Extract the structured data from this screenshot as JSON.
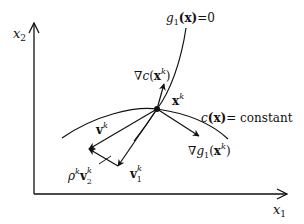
{
  "diagram": {
    "axes": {
      "x_label": "x",
      "x_sub": "1",
      "y_label": "x",
      "y_sub": "2"
    },
    "curves": {
      "constraint": {
        "func": "g",
        "sub": "1",
        "arg": "(x)",
        "rhs": "=0"
      },
      "contour": {
        "func": "c",
        "arg": "(x)",
        "rhs": "= constant"
      }
    },
    "point": {
      "label": "x",
      "sup": "k"
    },
    "vectors": {
      "grad_c": {
        "nabla": "∇",
        "func": "c",
        "open": "(",
        "var": "x",
        "sup": "k",
        "close": ")"
      },
      "grad_g1": {
        "nabla": "∇",
        "func": "g",
        "sub": "1",
        "open": "(",
        "var": "x",
        "sup": "k",
        "close": ")"
      },
      "v": {
        "var": "v",
        "sup": "k"
      },
      "v1": {
        "var": "v",
        "sup": "k",
        "sub": "1"
      },
      "v2": {
        "coef": "ρ",
        "coef_sup": "k",
        "var": "v",
        "sup": "k",
        "sub": "2"
      }
    },
    "colors": {
      "ink": "#111111",
      "background": "#ffffff"
    }
  }
}
